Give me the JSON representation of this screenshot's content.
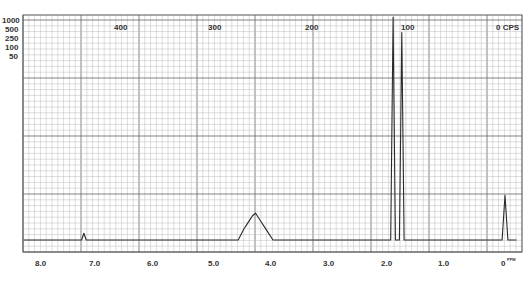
{
  "chart_data": {
    "type": "line",
    "title": "",
    "xlabel": "ppm",
    "ylabel": "",
    "x_axis_bottom": {
      "unit": "ppm",
      "ticks": [
        "8.0",
        "7.0",
        "6.0",
        "5.0",
        "4.0",
        "3.0",
        "2.0",
        "1.0",
        "0"
      ],
      "range": [
        8.3,
        -0.3
      ]
    },
    "x_axis_top": {
      "unit": "CPS",
      "ticks": [
        "400",
        "300",
        "200",
        "100",
        "0"
      ]
    },
    "y_scale_labels": [
      "1000",
      "500",
      "250",
      "100",
      "50"
    ],
    "grid": true,
    "peaks": [
      {
        "ppm": 7.26,
        "relative_height": 0.03,
        "label": "small singlet"
      },
      {
        "ppm": 4.3,
        "relative_height": 0.12,
        "label": "multiplet"
      },
      {
        "ppm": 1.93,
        "relative_height": 1.0,
        "label": "singlet"
      },
      {
        "ppm": 1.78,
        "relative_height": 0.93,
        "label": "singlet"
      },
      {
        "ppm": 0.0,
        "relative_height": 0.2,
        "label": "TMS reference"
      }
    ],
    "series": [
      {
        "name": "1H NMR spectrum",
        "x": [
          8.3,
          7.3,
          7.26,
          7.22,
          4.6,
          4.5,
          4.45,
          4.4,
          4.35,
          4.3,
          4.25,
          4.2,
          4.15,
          4.1,
          4.0,
          1.97,
          1.93,
          1.89,
          1.82,
          1.78,
          1.74,
          0.05,
          0.0,
          -0.05,
          -0.2
        ],
        "values": [
          0,
          0,
          0.03,
          0,
          0,
          0.05,
          0.07,
          0.09,
          0.11,
          0.12,
          0.1,
          0.08,
          0.06,
          0.04,
          0,
          0,
          1.0,
          0,
          0,
          0.93,
          0,
          0,
          0.2,
          0,
          0
        ]
      }
    ]
  },
  "labels": {
    "y_scale": [
      "1000",
      "500",
      "250",
      "100",
      "50"
    ],
    "cps": [
      "400",
      "300",
      "200",
      "100",
      "0 CPS"
    ],
    "ppm": [
      "8.0",
      "7.0",
      "6.0",
      "5.0",
      "4.0",
      "3.0",
      "2.0",
      "1.0",
      "0"
    ],
    "ppm_unit": "PPM"
  }
}
